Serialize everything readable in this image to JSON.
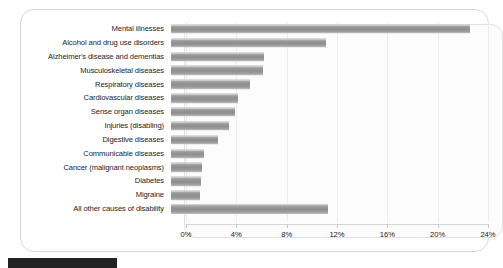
{
  "chart_data": {
    "type": "bar",
    "orientation": "horizontal",
    "title": "",
    "subtitle": "",
    "xlabel": "",
    "ylabel": "",
    "xlim": [
      0,
      24
    ],
    "xticks": [
      "0%",
      "4%",
      "8%",
      "12%",
      "16%",
      "20%",
      "24%"
    ],
    "xtick_values": [
      0,
      4,
      8,
      12,
      16,
      20,
      24
    ],
    "grid": true,
    "grid_axis": "x",
    "legend": "none",
    "unit": "%",
    "categories": [
      "Mental illnesses",
      "Alcohol and drug use disorders",
      "Alzheimer's disease and dementias",
      "Musculoskeletal diseases",
      "Respiratory diseases",
      "Cardiovascular diseases",
      "Sense organ diseases",
      "Injuries (disabling)",
      "Digestive diseases",
      "Communicable diseases",
      "Cancer (malignant neoplasms)",
      "Diabetes",
      "Migraine",
      "All other causes of disability"
    ],
    "values": [
      23.8,
      12.3,
      7.4,
      7.3,
      6.3,
      5.3,
      5.1,
      4.6,
      3.7,
      2.6,
      2.5,
      2.4,
      2.3,
      12.5
    ],
    "bar_color": "#9a9a9a"
  },
  "axis": {
    "tick_0": "0%",
    "tick_1": "4%",
    "tick_2": "8%",
    "tick_3": "12%",
    "tick_4": "16%",
    "tick_5": "20%",
    "tick_6": "24%"
  }
}
